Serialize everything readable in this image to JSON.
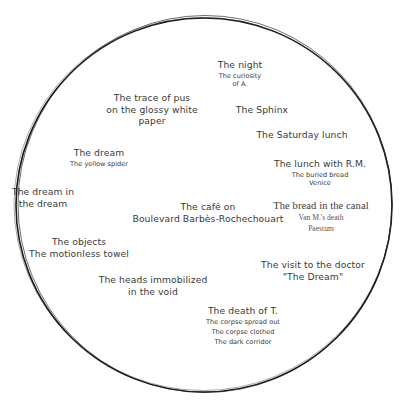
{
  "diagram": {
    "type": "memory-circle",
    "circle": {
      "cx": 204,
      "cy": 204,
      "r": 188,
      "stroke": "#1a1a1a"
    },
    "text_color": "#3a3a3a",
    "nodes": [
      {
        "id": "night",
        "title": "The night",
        "subs": [
          "The curiosity",
          "of A."
        ],
        "x": 240,
        "y": 59
      },
      {
        "id": "trace",
        "title": "The trace of pus",
        "lines": [
          "The trace of pus",
          "on the glossy white",
          "paper"
        ],
        "x": 152,
        "y": 93
      },
      {
        "id": "sphinx",
        "title": "The Sphinx",
        "x": 262,
        "y": 106
      },
      {
        "id": "saturday",
        "title": "The Saturday lunch",
        "x": 301,
        "y": 131
      },
      {
        "id": "dream",
        "title": "The dream",
        "subs": [
          "The yellow spider"
        ],
        "x": 99,
        "y": 148
      },
      {
        "id": "lunch-rm",
        "title": "The lunch with R.M.",
        "subs": [
          "The buried bread",
          "Venice"
        ],
        "x": 320,
        "y": 160
      },
      {
        "id": "dream-in-dream",
        "lines": [
          "The dream in",
          "the dream"
        ],
        "x": 43,
        "y": 188
      },
      {
        "id": "cafe",
        "lines": [
          "The café on",
          "Boulevard Barbès-Rochechouart"
        ],
        "x": 208,
        "y": 202
      },
      {
        "id": "bread-canal",
        "title": "The bread in the canal",
        "subs": [
          "Van M.'s death",
          "Paestum"
        ],
        "x": 320,
        "y": 201,
        "serif": true
      },
      {
        "id": "objects",
        "title": "The objects",
        "lines": [
          "The objects",
          "The motionless towel"
        ],
        "x": 79,
        "y": 238
      },
      {
        "id": "doctor",
        "lines": [
          "The visit to the doctor",
          "\"The Dream\""
        ],
        "x": 313,
        "y": 261
      },
      {
        "id": "heads",
        "lines": [
          "The heads immobilized",
          "in the void"
        ],
        "x": 153,
        "y": 276
      },
      {
        "id": "death-t",
        "title": "The death of T.",
        "subs": [
          "The corpse spread out",
          "The corpse clothed",
          "The dark corridor"
        ],
        "x": 243,
        "y": 307
      }
    ]
  }
}
